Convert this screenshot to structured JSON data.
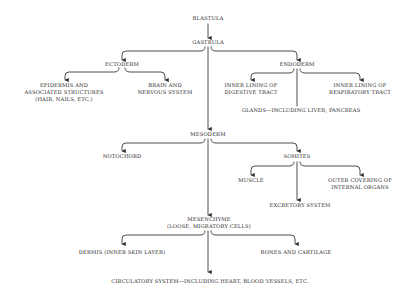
{
  "diagram": {
    "nodes": {
      "blastula": "BLASTULA",
      "gastrula": "GASTRULA",
      "ectoderm": "ECTODERM",
      "endoderm": "ENDODERM",
      "epidermis_1": "EPIDERMIS AND",
      "epidermis_2": "ASSOCIATED STRUCTURES",
      "epidermis_3": "(HAIR, NAILS, ETC.)",
      "brain_1": "BRAIN AND",
      "brain_2": "NERVOUS SYSTEM",
      "digestive_1": "INNER LINING OF",
      "digestive_2": "DIGESTIVE TRACT",
      "respiratory_1": "INNER LINING OF",
      "respiratory_2": "RESPIRATORY TRACT",
      "glands": "GLANDS—INCLUDING LIVER, PANCREAS",
      "mesoderm": "MESODERM",
      "notochord": "NOTOCHORD",
      "somites": "SOMITES",
      "muscle": "MUSCLE",
      "outer_covering_1": "OUTER COVERING OF",
      "outer_covering_2": "INTERNAL ORGANS",
      "excretory": "EXCRETORY SYSTEM",
      "mesenchyme_1": "MESENCHYME",
      "mesenchyme_2": "(LOOSE, MIGRATORY CELLS)",
      "dermis": "DERMIS (INNER SKIN LAYER)",
      "bones": "BONES AND CARTILAGE",
      "circulatory": "CIRCULATORY SYSTEM—INCLUDING HEART, BLOOD VESSELS, ETC."
    },
    "edges": [
      [
        "BLASTULA",
        "GASTRULA"
      ],
      [
        "GASTRULA",
        "ECTODERM"
      ],
      [
        "GASTRULA",
        "ENDODERM"
      ],
      [
        "GASTRULA",
        "MESODERM"
      ],
      [
        "ECTODERM",
        "EPIDERMIS AND ASSOCIATED STRUCTURES (HAIR, NAILS, ETC.)"
      ],
      [
        "ECTODERM",
        "BRAIN AND NERVOUS SYSTEM"
      ],
      [
        "ENDODERM",
        "INNER LINING OF DIGESTIVE TRACT"
      ],
      [
        "ENDODERM",
        "INNER LINING OF RESPIRATORY TRACT"
      ],
      [
        "ENDODERM",
        "GLANDS—INCLUDING LIVER, PANCREAS"
      ],
      [
        "MESODERM",
        "NOTOCHORD"
      ],
      [
        "MESODERM",
        "SOMITES"
      ],
      [
        "MESODERM",
        "MESENCHYME (LOOSE, MIGRATORY CELLS)"
      ],
      [
        "SOMITES",
        "MUSCLE"
      ],
      [
        "SOMITES",
        "EXCRETORY SYSTEM"
      ],
      [
        "SOMITES",
        "OUTER COVERING OF INTERNAL ORGANS"
      ],
      [
        "MESENCHYME",
        "DERMIS (INNER SKIN LAYER)"
      ],
      [
        "MESENCHYME",
        "BONES AND CARTILAGE"
      ],
      [
        "MESENCHYME",
        "CIRCULATORY SYSTEM—INCLUDING HEART, BLOOD VESSELS, ETC."
      ]
    ],
    "colors": {
      "line": "#3a3a3a",
      "text": "#2a2a2a",
      "background": "#ffffff"
    }
  }
}
